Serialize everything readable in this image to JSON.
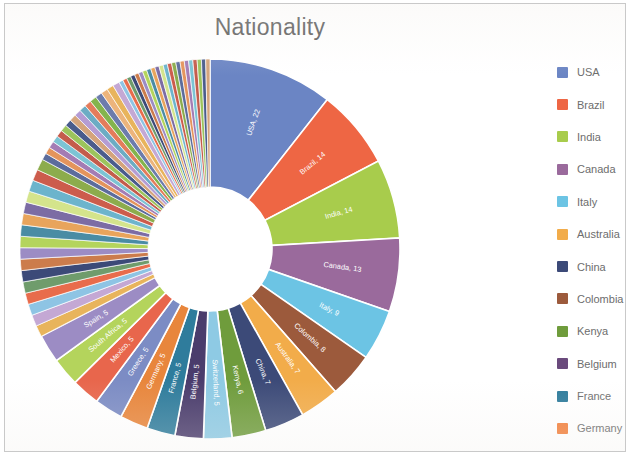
{
  "chart_data": {
    "type": "pie",
    "variant": "donut",
    "title": "Nationality",
    "xlabel": "",
    "ylabel": "",
    "legend_position": "right",
    "grid": false,
    "label_format": "name, value",
    "inner_radius_ratio": 0.33,
    "start_angle_deg": -90,
    "categories": [
      "USA",
      "Brazil",
      "India",
      "Canada",
      "Italy",
      "Colombia",
      "Australia",
      "China",
      "Kenya",
      "Switzerland",
      "Belgium",
      "France",
      "Germany",
      "Greece",
      "Mexico",
      "South Africa",
      "Spain"
    ],
    "values": [
      22,
      14,
      14,
      13,
      9,
      8,
      7,
      7,
      6,
      5,
      5,
      5,
      5,
      5,
      5,
      5,
      5
    ],
    "labeled_slices": [
      {
        "name": "USA",
        "value": 22,
        "label": "USA, 22",
        "color": "#6b85c4"
      },
      {
        "name": "Brazil",
        "value": 14,
        "label": "Brazil, 14",
        "color": "#ee6644"
      },
      {
        "name": "India",
        "value": 14,
        "label": "India, 14",
        "color": "#a8cc4c"
      },
      {
        "name": "Canada",
        "value": 13,
        "label": "Canada, 13",
        "color": "#9a6a9c"
      },
      {
        "name": "Italy",
        "value": 9,
        "label": "Italy, 9",
        "color": "#6cc4e4"
      },
      {
        "name": "Colombia",
        "value": 8,
        "label": "Colombia, 8",
        "color": "#9c5a3c"
      },
      {
        "name": "Australia",
        "value": 7,
        "label": "Australia, 7",
        "color": "#f2ac4a"
      },
      {
        "name": "China",
        "value": 7,
        "label": "China, 7",
        "color": "#3c4a78"
      },
      {
        "name": "Kenya",
        "value": 6,
        "label": "Kenya, 6",
        "color": "#6f9c3c"
      },
      {
        "name": "Switzerland",
        "value": 5,
        "label": "Switzerland, 5",
        "color": "#8ecae4"
      },
      {
        "name": "Belgium",
        "value": 5,
        "label": "Belgium, 5",
        "color": "#4a3c6c"
      },
      {
        "name": "France",
        "value": 5,
        "label": "France, 5",
        "color": "#2f7c9c"
      },
      {
        "name": "Germany",
        "value": 5,
        "label": "Germany, 5",
        "color": "#e8863c"
      },
      {
        "name": "Greece",
        "value": 5,
        "label": "Greece, 5",
        "color": "#7c8cc4"
      },
      {
        "name": "Mexico",
        "value": 5,
        "label": "Mexico, 5",
        "color": "#e8664c"
      },
      {
        "name": "South Africa",
        "value": 5,
        "label": "South Africa, 5",
        "color": "#b4d45c"
      },
      {
        "name": "Spain",
        "value": 5,
        "label": "Spain, 5",
        "color": "#9c8cc4"
      }
    ],
    "tail_note": "long tail of unlabeled thin slices",
    "tail_slice_count": 54
  },
  "chart": {
    "title": "Nationality"
  },
  "legend": {
    "items": [
      {
        "label": "USA",
        "color": "#6b85c4"
      },
      {
        "label": "Brazil",
        "color": "#ee6644"
      },
      {
        "label": "India",
        "color": "#a8cc4c"
      },
      {
        "label": "Canada",
        "color": "#9a6a9c"
      },
      {
        "label": "Italy",
        "color": "#6cc4e4"
      },
      {
        "label": "Australia",
        "color": "#f2ac4a"
      },
      {
        "label": "China",
        "color": "#3c4a78"
      },
      {
        "label": "Colombia",
        "color": "#9c5a3c"
      },
      {
        "label": "Kenya",
        "color": "#6f9c3c"
      },
      {
        "label": "Belgium",
        "color": "#6a4a7c"
      },
      {
        "label": "France",
        "color": "#2f7c9c"
      },
      {
        "label": "Germany",
        "color": "#f2803c"
      }
    ]
  }
}
